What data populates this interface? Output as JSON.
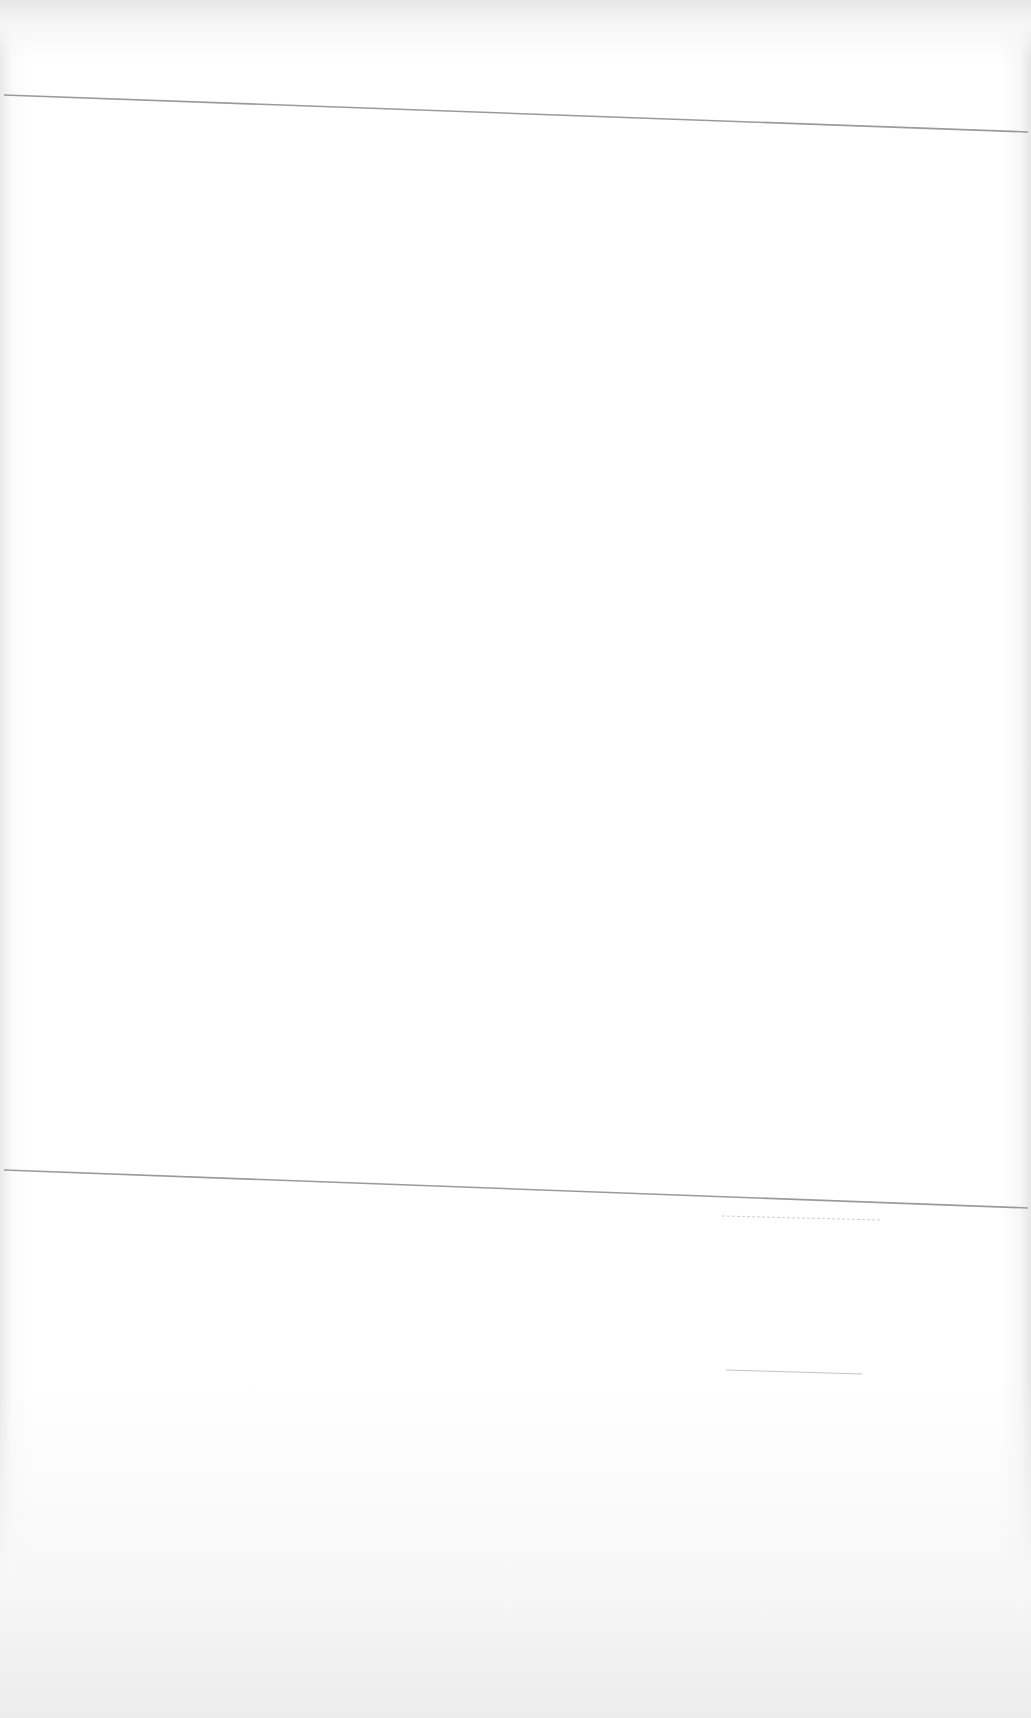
{
  "document": {
    "type": "scanned-page",
    "content_visible": false,
    "elements": [
      {
        "kind": "horizontal-rule",
        "position": "top"
      },
      {
        "kind": "horizontal-rule",
        "position": "bottom"
      },
      {
        "kind": "blank-line",
        "position": "bottom-right-upper"
      },
      {
        "kind": "blank-line",
        "position": "bottom-right-lower"
      }
    ],
    "colors": {
      "paper": "#ffffff",
      "rule": "#9a9a9a",
      "faint_line": "#c8c8c8"
    }
  }
}
